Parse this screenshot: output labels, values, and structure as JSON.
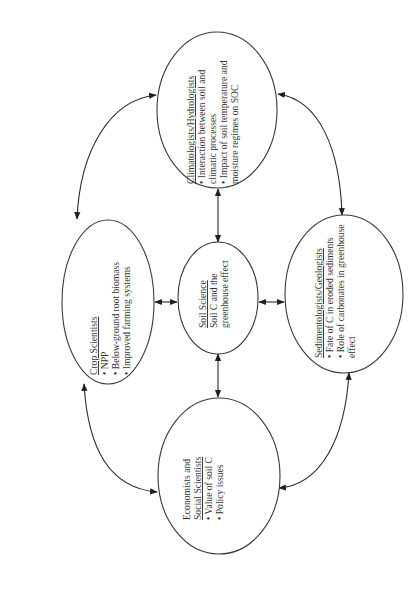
{
  "diagram": {
    "orientation": "rotated -90deg (text reads bottom-to-top)",
    "colors": {
      "stroke": "#3a3a3a",
      "text": "#333333",
      "background": "#ffffff"
    },
    "center_node": {
      "title": "Soil Science",
      "lines": [
        "Soil C and the",
        "greenhouse effect"
      ]
    },
    "nodes": {
      "climatologists": {
        "title": "Climatologists/Hydrologists",
        "lines": [
          "• Interaction between soil and",
          "   climatic processes",
          "• Impact of soil temperature and",
          "   moisture regimes on SOC"
        ]
      },
      "crop": {
        "title": "Crop Scientists",
        "lines": [
          "• NPP",
          "• Below-ground root biomass",
          "• Improved farming systems"
        ]
      },
      "sedimentologists": {
        "title": "Sedimentologists/Geologists",
        "lines": [
          "• Fate of C in eroded sediments",
          "• Role of carbonates in greenhouse",
          "   effect"
        ]
      },
      "economists": {
        "pre_title": "Economists  and",
        "title": "Social Scientists",
        "lines": [
          "• Value of soil C",
          "• Policy issues"
        ]
      }
    },
    "connections": [
      {
        "from": "soil-science",
        "to": "climatologists",
        "style": "double-arrow"
      },
      {
        "from": "soil-science",
        "to": "crop",
        "style": "double-arrow"
      },
      {
        "from": "soil-science",
        "to": "sedimentologists",
        "style": "double-arrow"
      },
      {
        "from": "soil-science",
        "to": "economists",
        "style": "double-arrow"
      },
      {
        "from": "crop",
        "to": "climatologists",
        "style": "curved-double-arrow"
      },
      {
        "from": "climatologists",
        "to": "sedimentologists",
        "style": "curved-double-arrow"
      },
      {
        "from": "sedimentologists",
        "to": "economists",
        "style": "curved-double-arrow"
      },
      {
        "from": "economists",
        "to": "crop",
        "style": "curved-double-arrow"
      }
    ]
  }
}
